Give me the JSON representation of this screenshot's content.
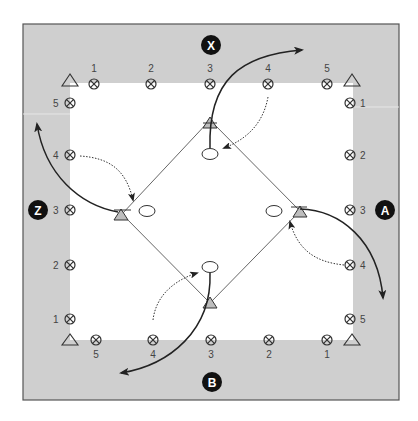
{
  "diagram": {
    "title": "",
    "colors": {
      "field_grey": "#cfcfcf",
      "inner_white": "#ffffff",
      "border": "#555555",
      "line": "#333333",
      "marker_fill": "#bdbdbd",
      "team_badge": "#111111"
    },
    "teams": {
      "top": {
        "label": "X"
      },
      "right": {
        "label": "A"
      },
      "bottom": {
        "label": "B"
      },
      "left": {
        "label": "Z"
      }
    },
    "players": {
      "top": [
        "1",
        "2",
        "3",
        "4",
        "5"
      ],
      "right": [
        "1",
        "2",
        "3",
        "4",
        "5"
      ],
      "bottom": [
        "5",
        "4",
        "3",
        "2",
        "1"
      ],
      "left": [
        "5",
        "4",
        "3",
        "2",
        "1"
      ]
    },
    "icons": {
      "player": "circled-x-icon",
      "cone": "triangle-cone-icon",
      "base": "oval-base-icon",
      "run_path": "solid-curved-arrow",
      "pass_path": "dotted-curved-arrow"
    }
  }
}
